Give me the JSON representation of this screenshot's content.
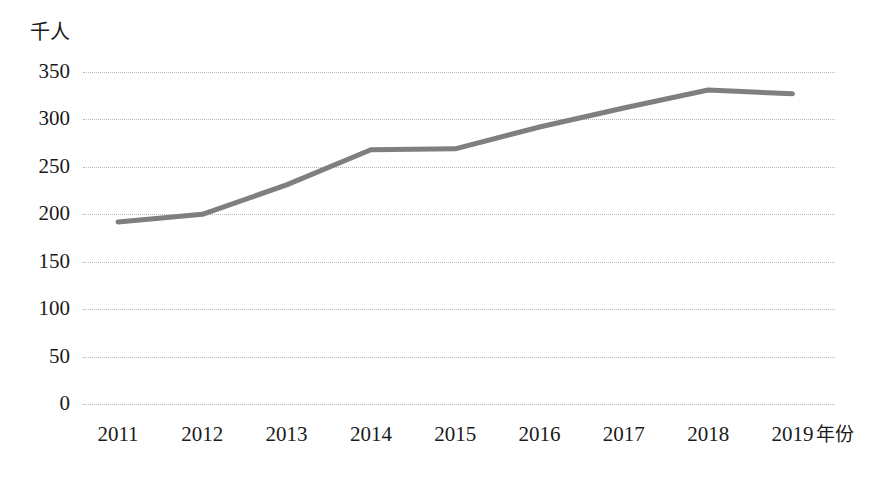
{
  "chart_data": {
    "type": "line",
    "title": "",
    "subtitle": "",
    "xlabel": "年份",
    "ylabel": "千人",
    "categories": [
      "2011",
      "2012",
      "2013",
      "2014",
      "2015",
      "2016",
      "2017",
      "2018",
      "2019"
    ],
    "values": [
      192,
      200,
      231,
      268,
      269,
      292,
      312,
      331,
      327
    ],
    "series": [
      {
        "name": "",
        "values": [
          192,
          200,
          231,
          268,
          269,
          292,
          312,
          331,
          327
        ]
      }
    ],
    "ylim": [
      0,
      350
    ],
    "yticks": [
      0,
      50,
      100,
      150,
      200,
      250,
      300,
      350
    ],
    "xticks": [
      "2011",
      "2012",
      "2013",
      "2014",
      "2015",
      "2016",
      "2017",
      "2018",
      "2019"
    ],
    "grid": "horizontal-dotted",
    "legend": "none",
    "line_color": "#7f7f7f",
    "grid_color": "#b9b9b9",
    "background": "#ffffff"
  },
  "axes": {
    "y_unit_label": "千人",
    "x_axis_title": "年份",
    "y_tick_labels": [
      "350",
      "300",
      "250",
      "200",
      "150",
      "100",
      "50",
      "0"
    ],
    "x_tick_labels": [
      "2011",
      "2012",
      "2013",
      "2014",
      "2015",
      "2016",
      "2017",
      "2018",
      "2019"
    ]
  }
}
